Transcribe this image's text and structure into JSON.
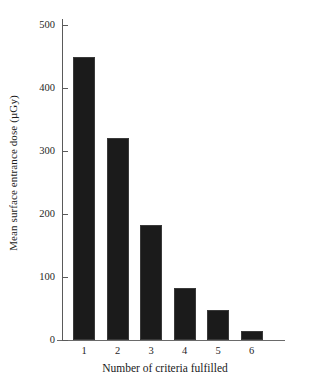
{
  "chart_data": {
    "type": "bar",
    "title": "",
    "subtitle": "",
    "xlabel": "Number of criteria fulfilled",
    "ylabel": "Mean surface entrance dose (µGy)",
    "categories": [
      "1",
      "2",
      "3",
      "4",
      "5",
      "6"
    ],
    "values": [
      450,
      320,
      183,
      82,
      48,
      15
    ],
    "series": [
      {
        "name": "Mean surface entrance dose",
        "values": [
          450,
          320,
          183,
          82,
          48,
          15
        ]
      }
    ],
    "ylim": [
      0,
      500
    ],
    "ytick_labels": [
      "0",
      "100",
      "200",
      "300",
      "400",
      "500"
    ],
    "ytick_values": [
      0,
      100,
      200,
      300,
      400,
      500
    ],
    "grid": false,
    "legend": false,
    "legend_position": "none",
    "bar_color": "#1b1b1b",
    "axis_color": "#5a5a5a",
    "background_color": "#ffffff",
    "annotations": []
  }
}
